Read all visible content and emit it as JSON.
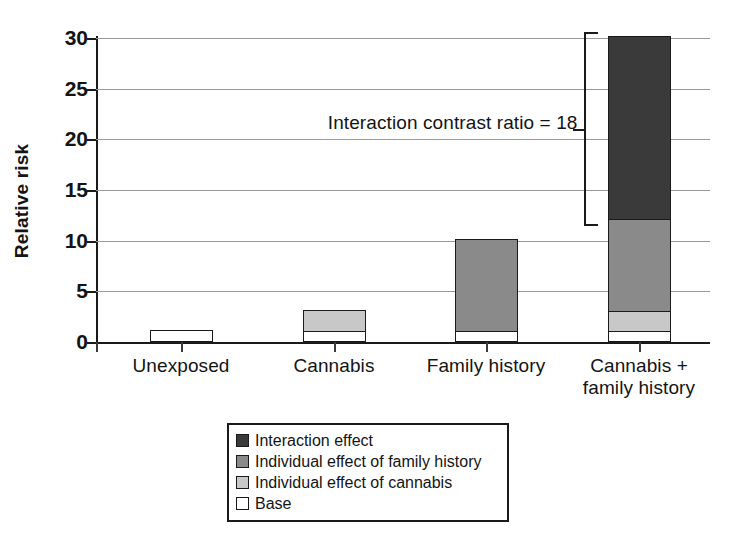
{
  "chart_data": {
    "type": "bar",
    "subtype": "stacked-bar",
    "title": "",
    "xlabel": "",
    "ylabel": "Relative risk",
    "ylim": [
      0,
      30
    ],
    "yticks": [
      0,
      5,
      10,
      15,
      20,
      25,
      30
    ],
    "ytick_labels": [
      "0",
      "5",
      "10",
      "15",
      "20",
      "25",
      "30"
    ],
    "grid": true,
    "legend_position": "bottom",
    "categories": [
      "Unexposed",
      "Cannabis",
      "Family history",
      "Cannabis +\nfamily history"
    ],
    "category_lines": [
      [
        "Unexposed"
      ],
      [
        "Cannabis"
      ],
      [
        "Family history"
      ],
      [
        "Cannabis +",
        "family history"
      ]
    ],
    "series": [
      {
        "name": "Base",
        "values": [
          1,
          1,
          1,
          1
        ],
        "color": "#ffffff"
      },
      {
        "name": "Individual effect of cannabis",
        "values": [
          0,
          2,
          0,
          2
        ],
        "color": "#c8c8c8"
      },
      {
        "name": "Individual effect of family history",
        "values": [
          0,
          0,
          9,
          9
        ],
        "color": "#8a8a8a"
      },
      {
        "name": "Interaction effect",
        "values": [
          0,
          0,
          0,
          18
        ],
        "color": "#3a3a3a"
      }
    ],
    "totals": [
      1,
      3,
      10,
      30
    ],
    "annotations": [
      {
        "text": "Interaction contrast ratio = 18",
        "type": "bracket-label",
        "bracket_from": 12,
        "bracket_to": 30,
        "value": 18
      }
    ]
  },
  "axis": {
    "y_title": "Relative risk",
    "y_tick_labels": [
      "30",
      "25",
      "20",
      "15",
      "10",
      "5",
      "0"
    ]
  },
  "annotation": {
    "interaction_contrast": "Interaction contrast ratio = 18"
  },
  "x_labels": [
    {
      "line1": "Unexposed",
      "line2": ""
    },
    {
      "line1": "Cannabis",
      "line2": ""
    },
    {
      "line1": "Family history",
      "line2": ""
    },
    {
      "line1": "Cannabis +",
      "line2": "family history"
    }
  ],
  "legend": {
    "items": [
      {
        "label": "Interaction effect",
        "color": "#3a3a3a"
      },
      {
        "label": "Individual effect of family history",
        "color": "#8a8a8a"
      },
      {
        "label": "Individual effect of cannabis",
        "color": "#c8c8c8"
      },
      {
        "label": "Base",
        "color": "#ffffff"
      }
    ]
  },
  "colors": {
    "interaction_effect": "#3a3a3a",
    "family_history_effect": "#8a8a8a",
    "cannabis_effect": "#c8c8c8",
    "base": "#ffffff",
    "axis": "#1a1a1a",
    "grid": "#9a9a9a"
  }
}
